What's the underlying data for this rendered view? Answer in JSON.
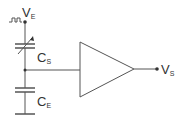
{
  "diagram": {
    "type": "circuit",
    "colors": {
      "line": "#555555",
      "text": "#333333"
    },
    "labels": {
      "input_main": "V",
      "input_sub": "E",
      "cap_series_main": "C",
      "cap_series_sub": "S",
      "cap_earth_main": "C",
      "cap_earth_sub": "E",
      "output_main": "V",
      "output_sub": "S"
    },
    "components": [
      {
        "id": "input-node",
        "label": "VE",
        "symbol": "pulse-source"
      },
      {
        "id": "variable-capacitor",
        "label": "CS"
      },
      {
        "id": "capacitor",
        "label": "CE"
      },
      {
        "id": "ground",
        "label": ""
      },
      {
        "id": "amplifier",
        "label": ""
      },
      {
        "id": "output-node",
        "label": "VS"
      }
    ]
  }
}
